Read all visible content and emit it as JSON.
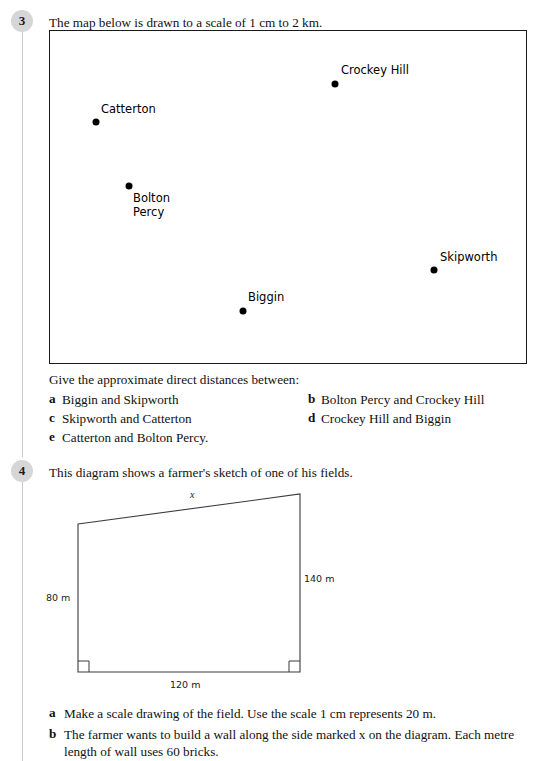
{
  "questions": [
    {
      "number": "3",
      "stem": "The map below is drawn to a scale of 1 cm to 2 km.",
      "map": {
        "places": [
          {
            "name": "Crockey Hill",
            "dot_x": 335,
            "dot_y": 84,
            "label_x": 341,
            "label_y": 64
          },
          {
            "name": "Catterton",
            "dot_x": 96,
            "dot_y": 122,
            "label_x": 101,
            "label_y": 103
          },
          {
            "name": "Bolton\nPercy",
            "dot_x": 129,
            "dot_y": 186,
            "label_x": 133,
            "label_y": 192
          },
          {
            "name": "Skipworth",
            "dot_x": 434,
            "dot_y": 270,
            "label_x": 440,
            "label_y": 251
          },
          {
            "name": "Biggin",
            "dot_x": 243,
            "dot_y": 311,
            "label_x": 248,
            "label_y": 291
          }
        ]
      },
      "prompt": "Give the approximate direct distances between:",
      "parts": [
        {
          "label": "a",
          "text": "Biggin and Skipworth"
        },
        {
          "label": "b",
          "text": "Bolton Percy and Crockey Hill"
        },
        {
          "label": "c",
          "text": "Skipworth and Catterton"
        },
        {
          "label": "d",
          "text": "Crockey Hill and Biggin"
        },
        {
          "label": "e",
          "text": "Catterton and Bolton Percy."
        }
      ]
    },
    {
      "number": "4",
      "stem": "This diagram shows a farmer's sketch of one of his fields.",
      "field": {
        "side_x_label": "x",
        "left_side_label": "80 m",
        "right_side_label": "140 m",
        "base_label": "120 m"
      },
      "parts": [
        {
          "label": "a",
          "text": "Make a scale drawing of the field. Use the scale 1 cm represents 20 m."
        },
        {
          "label": "b",
          "text": "The farmer wants to build a wall along the side marked x on the diagram. Each metre length of wall uses 60 bricks."
        }
      ]
    }
  ]
}
